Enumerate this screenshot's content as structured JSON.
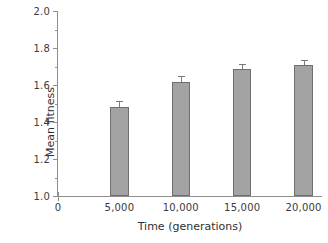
{
  "chart_data": {
    "type": "bar",
    "title": "",
    "xlabel": "Time (generations)",
    "ylabel": "Mean fitness",
    "categories": [
      "5,000",
      "10,000",
      "15,000",
      "20,000"
    ],
    "x": [
      5000,
      10000,
      15000,
      20000
    ],
    "values": [
      1.48,
      1.615,
      1.685,
      1.71
    ],
    "errors": [
      0.035,
      0.035,
      0.03,
      0.025
    ],
    "xlim": [
      0,
      21500
    ],
    "ylim": [
      1.0,
      2.0
    ],
    "y_ticks": [
      1.0,
      1.2,
      1.4,
      1.6,
      1.8,
      2.0
    ],
    "y_tick_labels": [
      "1.0",
      "1.2",
      "1.4",
      "1.6",
      "1.8",
      "2.0"
    ],
    "y_minor_ticks": [
      1.1,
      1.3,
      1.5,
      1.7,
      1.9
    ],
    "x_ticks": [
      0,
      5000,
      10000,
      15000,
      20000
    ],
    "x_tick_labels": [
      "0",
      "5,000",
      "10,000",
      "15,000",
      "20,000"
    ],
    "grid": false,
    "legend": null,
    "bar_fill_color": "#a3a3a3",
    "bar_edge_color": "#6f6f6f",
    "error_bar_color": "#7a7a7a",
    "axis_color": "#8e8e8e",
    "text_color": "#2f2f2f",
    "background_color": "#ffffff",
    "bar_width_units": 1500
  }
}
